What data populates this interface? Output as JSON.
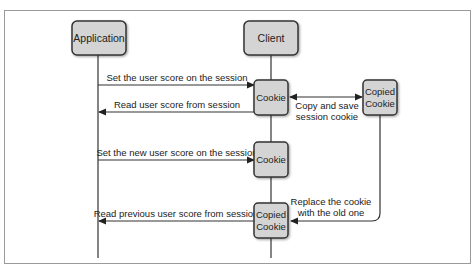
{
  "diagram": {
    "type": "sequence",
    "participants": [
      {
        "id": "application",
        "label": "Application"
      },
      {
        "id": "client",
        "label": "Client"
      }
    ],
    "nodes": {
      "cookie_1": {
        "label": "Cookie"
      },
      "copied_cookie_right": {
        "line1": "Copied",
        "line2": "Cookie"
      },
      "cookie_2": {
        "label": "Cookie"
      },
      "copied_cookie_bottom": {
        "line1": "Copied",
        "line2": "Cookie"
      }
    },
    "messages": [
      {
        "id": "set_score",
        "label": "Set the user score on the session",
        "from": "Application",
        "to": "Cookie"
      },
      {
        "id": "read_score",
        "label": "Read user score from session",
        "from": "Cookie",
        "to": "Application"
      },
      {
        "id": "copy_save",
        "line1": "Copy and save",
        "line2": "session cookie",
        "from": "Cookie",
        "to": "Copied Cookie",
        "bidirectional": true
      },
      {
        "id": "set_new_score",
        "label": "Set the new user score on the session",
        "from": "Application",
        "to": "Cookie"
      },
      {
        "id": "replace_cookie",
        "line1": "Replace the cookie",
        "line2": "with the old one",
        "from": "Copied Cookie",
        "to": "Copied Cookie (client)"
      },
      {
        "id": "read_previous",
        "label": "Read previous user score from session",
        "from": "Copied Cookie",
        "to": "Application"
      }
    ],
    "colors": {
      "box_fill": "#d4d4d4",
      "box_stroke": "#333333",
      "line": "#333333",
      "frame": "#999999",
      "background": "#ffffff"
    }
  }
}
